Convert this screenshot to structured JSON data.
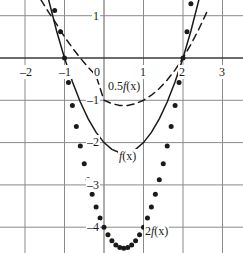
{
  "chart_data": {
    "type": "line",
    "title": "",
    "xlabel": "",
    "ylabel": "",
    "xlim": [
      -2.6,
      3.5
    ],
    "ylim": [
      -4.6,
      1.4
    ],
    "grid": true,
    "grid_spacing": {
      "x": 1,
      "y": 1
    },
    "legend_position": "inline-annotations",
    "x_ticks": [
      "-2",
      "-1",
      "0",
      "1",
      "2",
      "3"
    ],
    "x_tick_values": [
      -2,
      -1,
      0,
      1,
      2,
      3
    ],
    "y_ticks": [
      "1",
      "-1",
      "-2",
      "-3",
      "-4"
    ],
    "y_tick_values": [
      1,
      -1,
      -2,
      -3,
      -4
    ],
    "series": [
      {
        "name": "0.5f(x)",
        "style": "dashed",
        "color": "#1a1a1a",
        "formula": "0.5*(x^2 - x - 2)",
        "vertex": [
          0.5,
          -1.125
        ],
        "roots": [
          -1,
          2
        ],
        "x": [
          -1.6,
          -1.4,
          -1.2,
          -1.0,
          -0.8,
          -0.6,
          -0.4,
          -0.2,
          0.0,
          0.2,
          0.4,
          0.5,
          0.6,
          0.8,
          1.0,
          1.2,
          1.4,
          1.6,
          1.8,
          2.0,
          2.2,
          2.4,
          2.6
        ],
        "y": [
          1.38,
          1.08,
          0.8,
          0.5,
          0.24,
          0.0,
          -0.22,
          -0.42,
          -1.0,
          -1.08,
          -1.12,
          -1.125,
          -1.12,
          -1.08,
          -1.0,
          -0.88,
          -0.72,
          -0.52,
          -0.28,
          0.0,
          0.32,
          0.68,
          1.08
        ]
      },
      {
        "name": "f(x)",
        "style": "solid",
        "color": "#1a1a1a",
        "formula": "x^2 - x - 2",
        "vertex": [
          0.5,
          -2.25
        ],
        "roots": [
          -1,
          2
        ],
        "x": [
          -1.45,
          -1.2,
          -1.0,
          -0.8,
          -0.6,
          -0.4,
          -0.2,
          0.0,
          0.2,
          0.4,
          0.5,
          0.6,
          0.8,
          1.0,
          1.2,
          1.4,
          1.6,
          1.8,
          2.0,
          2.2,
          2.45
        ],
        "y": [
          1.55,
          0.64,
          0.0,
          -0.56,
          -1.04,
          -1.44,
          -1.76,
          -2.0,
          -2.16,
          -2.24,
          -2.25,
          -2.24,
          -2.16,
          -2.0,
          -1.76,
          -1.44,
          -1.04,
          -0.56,
          0.0,
          0.64,
          1.55
        ]
      },
      {
        "name": "2f(x)",
        "style": "dotted",
        "color": "#1a1a1a",
        "formula": "2*(x^2 - x - 2)",
        "vertex": [
          0.5,
          -4.5
        ],
        "roots": [
          -1,
          2
        ],
        "x": [
          -1.25,
          -1.1,
          -1.0,
          -0.9,
          -0.8,
          -0.7,
          -0.6,
          -0.5,
          -0.4,
          -0.3,
          -0.2,
          -0.1,
          0.0,
          0.1,
          0.2,
          0.3,
          0.4,
          0.5,
          0.6,
          0.7,
          0.8,
          0.9,
          1.0,
          1.1,
          1.2,
          1.3,
          1.4,
          1.5,
          1.6,
          1.7,
          1.8,
          1.9,
          2.0,
          2.1,
          2.2
        ],
        "y": [
          1.12,
          0.62,
          0.0,
          -0.58,
          -1.12,
          -1.62,
          -2.08,
          -2.5,
          -2.88,
          -3.22,
          -3.52,
          -3.78,
          -4.0,
          -4.18,
          -4.32,
          -4.42,
          -4.48,
          -4.5,
          -4.48,
          -4.42,
          -4.32,
          -4.18,
          -4.0,
          -3.78,
          -3.52,
          -3.22,
          -2.88,
          -2.5,
          -2.08,
          -1.62,
          -1.12,
          -0.58,
          0.0,
          0.62,
          1.28
        ]
      }
    ],
    "annotations": [
      {
        "text": "0.5f(x)",
        "x": 0.08,
        "y": -0.62
      },
      {
        "text": "f(x)",
        "x": 0.42,
        "y": -2.62
      },
      {
        "text": "2f(x)",
        "x": 1.12,
        "y": -4.18
      }
    ]
  },
  "axes": {
    "x_tick_labels": [
      {
        "text": "-2",
        "px": 19,
        "py": 66
      },
      {
        "text": "-1",
        "px": 58,
        "py": 66
      },
      {
        "text": "0",
        "px": 93,
        "py": 66
      },
      {
        "text": "1",
        "px": 139,
        "py": 66
      },
      {
        "text": "2",
        "px": 178,
        "py": 66
      },
      {
        "text": "3",
        "px": 218,
        "py": 66
      }
    ],
    "y_tick_labels": [
      {
        "text": "1",
        "px": 92,
        "py": 10
      },
      {
        "text": "-1",
        "px": 86,
        "py": 94
      },
      {
        "text": "-2",
        "px": 86,
        "py": 136
      },
      {
        "text": "-3",
        "px": 86,
        "py": 179
      },
      {
        "text": "-4",
        "px": 86,
        "py": 221
      }
    ],
    "curve_labels": [
      {
        "id": "label-half-f",
        "text_prefix": "0.5",
        "text_italic": "f",
        "text_suffix": "(x)",
        "px": 107,
        "py": 80
      },
      {
        "id": "label-f",
        "text_prefix": "",
        "text_italic": "f",
        "text_suffix": "(x)",
        "px": 118,
        "py": 150
      },
      {
        "id": "label-two-f",
        "text_prefix": "2",
        "text_italic": "f",
        "text_suffix": "(x)",
        "px": 144,
        "py": 225
      }
    ]
  },
  "colors": {
    "grid": "#8a8a8a",
    "axis": "#3a3a3a",
    "curve": "#1a1a1a",
    "background": "#ffffff"
  }
}
